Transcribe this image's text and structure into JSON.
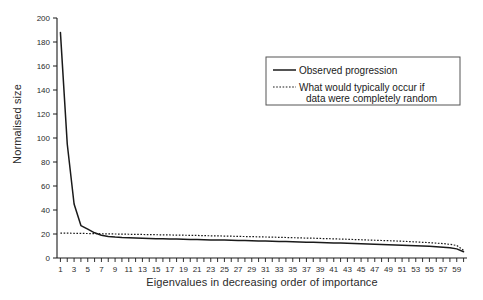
{
  "chart_data": {
    "type": "line",
    "title": "",
    "xlabel": "Eigenvalues in decreasing order of importance",
    "ylabel": "Normalised size",
    "xlim": [
      0.5,
      60.5
    ],
    "ylim": [
      0,
      200
    ],
    "grid": false,
    "legend_position": "upper-right",
    "yticks": [
      0,
      20,
      40,
      60,
      80,
      100,
      120,
      140,
      160,
      180,
      200
    ],
    "xticks": [
      1,
      3,
      5,
      7,
      9,
      11,
      13,
      15,
      17,
      19,
      21,
      23,
      25,
      27,
      29,
      31,
      33,
      35,
      37,
      39,
      41,
      43,
      45,
      47,
      49,
      51,
      53,
      55,
      57,
      59
    ],
    "x": [
      1,
      2,
      3,
      4,
      5,
      6,
      7,
      8,
      9,
      10,
      11,
      12,
      13,
      14,
      15,
      16,
      17,
      18,
      19,
      20,
      21,
      22,
      23,
      24,
      25,
      26,
      27,
      28,
      29,
      30,
      31,
      32,
      33,
      34,
      35,
      36,
      37,
      38,
      39,
      40,
      41,
      42,
      43,
      44,
      45,
      46,
      47,
      48,
      49,
      50,
      51,
      52,
      53,
      54,
      55,
      56,
      57,
      58,
      59,
      60
    ],
    "series": [
      {
        "name": "Observed progression",
        "style": "solid",
        "color": "#1a1a1a",
        "values": [
          188,
          95,
          45,
          27,
          24,
          21,
          19,
          18,
          17.4,
          17.0,
          16.8,
          16.6,
          16.4,
          16.2,
          16.1,
          16.0,
          15.9,
          15.8,
          15.6,
          15.5,
          15.4,
          15.3,
          15.1,
          15.0,
          14.9,
          14.8,
          14.6,
          14.5,
          14.4,
          14.2,
          14.1,
          14.0,
          13.8,
          13.7,
          13.5,
          13.4,
          13.2,
          13.1,
          12.9,
          12.8,
          12.6,
          12.4,
          12.3,
          12.1,
          11.9,
          11.7,
          11.5,
          11.3,
          11.1,
          10.9,
          10.7,
          10.5,
          10.2,
          10.0,
          9.7,
          9.4,
          9.0,
          8.5,
          7.6,
          5.2
        ]
      },
      {
        "name": "What would typically occur if data were completely random",
        "style": "dotted",
        "color": "#1a1a1a",
        "values": [
          20.8,
          20.7,
          20.6,
          20.5,
          20.4,
          20.3,
          20.2,
          20.1,
          20.0,
          19.9,
          19.8,
          19.7,
          19.6,
          19.5,
          19.4,
          19.3,
          19.2,
          19.1,
          19.0,
          18.9,
          18.8,
          18.6,
          18.5,
          18.4,
          18.3,
          18.2,
          18.0,
          17.9,
          17.8,
          17.6,
          17.5,
          17.4,
          17.2,
          17.1,
          16.9,
          16.8,
          16.6,
          16.5,
          16.3,
          16.1,
          16.0,
          15.8,
          15.6,
          15.4,
          15.2,
          15.0,
          14.8,
          14.6,
          14.4,
          14.2,
          14.0,
          13.7,
          13.4,
          13.1,
          12.8,
          12.4,
          12.0,
          11.4,
          10.4,
          6.4
        ]
      }
    ],
    "legend": [
      {
        "label": "Observed progression",
        "style": "solid"
      },
      {
        "label": "What would typically occur if",
        "label2": "data were completely random",
        "style": "dotted"
      }
    ]
  },
  "axes": {
    "y_title": "Normalised size",
    "x_title": "Eigenvalues in decreasing order of importance"
  },
  "legend": {
    "line1": "Observed progression",
    "line2a": "What would typically occur if",
    "line2b": "data were completely random"
  },
  "colors": {
    "background": "#ffffff",
    "axis": "#1a1a1a",
    "line": "#1a1a1a",
    "legend_border": "#555555"
  }
}
